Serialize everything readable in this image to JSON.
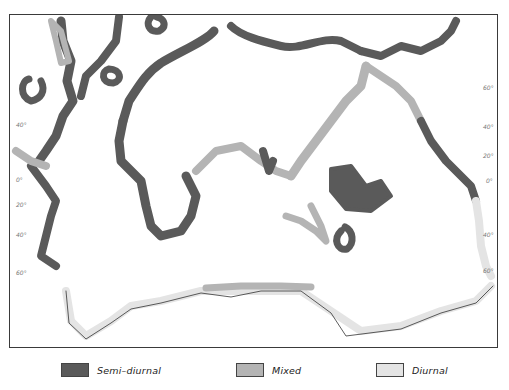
{
  "map": {
    "subject": "World distribution of tide types along coastlines",
    "colors": {
      "semi_diurnal": "#5a5a5a",
      "mixed": "#b4b4b4",
      "diurnal": "#e4e4e4",
      "land_outline": "#333333",
      "frame": "#3a3a3a"
    },
    "left_axis": [
      {
        "label": "40°",
        "y": 125
      },
      {
        "label": "0°",
        "y": 180
      },
      {
        "label": "20°",
        "y": 205
      },
      {
        "label": "40°",
        "y": 235
      },
      {
        "label": "60°",
        "y": 273
      }
    ],
    "right_axis": [
      {
        "label": "60°",
        "y": 88
      },
      {
        "label": "40°",
        "y": 127
      },
      {
        "label": "20°",
        "y": 156
      },
      {
        "label": "0°",
        "y": 181
      },
      {
        "label": "40°",
        "y": 235
      },
      {
        "label": "60°",
        "y": 271
      }
    ]
  },
  "legend": {
    "items": [
      {
        "label": "Semi–diurnal",
        "color": "#5a5a5a"
      },
      {
        "label": "Mixed",
        "color": "#b4b4b4"
      },
      {
        "label": "Diurnal",
        "color": "#e4e4e4"
      }
    ]
  }
}
